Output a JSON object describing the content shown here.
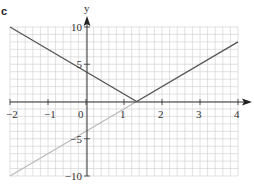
{
  "panel_label": "c",
  "chart_data": {
    "type": "line",
    "title": "",
    "xlabel": "",
    "ylabel": "y",
    "xlim": [
      -2,
      4
    ],
    "ylim": [
      -10,
      10
    ],
    "grid": true,
    "grid_minor_x": 0.2,
    "grid_minor_y": 1,
    "x_ticks": [
      -2,
      -1,
      0,
      1,
      2,
      3,
      4
    ],
    "x_tick_labels": [
      "−2",
      "−1",
      "0",
      "1",
      "2",
      "3",
      "4"
    ],
    "y_ticks": [
      10,
      5,
      -5,
      -10
    ],
    "y_tick_labels": [
      "10",
      "5",
      "−5",
      "−10"
    ],
    "series": [
      {
        "name": "y = |3x − 4|",
        "color": "#555555",
        "points": [
          [
            -2,
            10
          ],
          [
            1.333,
            0
          ],
          [
            4,
            8
          ]
        ]
      },
      {
        "name": "y = 3x − 4 (x < 4/3)",
        "color": "#bbbbbb",
        "points": [
          [
            -2,
            -10
          ],
          [
            1.333,
            0
          ]
        ]
      }
    ],
    "colors": {
      "grid": "#cccccc",
      "axis": "#333333"
    }
  }
}
